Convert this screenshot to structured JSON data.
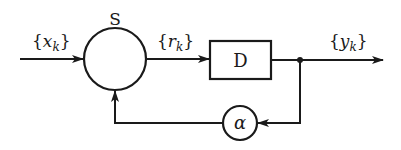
{
  "diagram": {
    "type": "block-diagram",
    "colors": {
      "stroke": "#1a1a1a",
      "background": "#ffffff"
    },
    "nodes": {
      "summer": {
        "label": "S",
        "shape": "circle"
      },
      "delay": {
        "label": "D",
        "shape": "rectangle"
      },
      "gain": {
        "label": "α",
        "shape": "circle"
      }
    },
    "signals": {
      "input": {
        "open": "{",
        "var": "x",
        "sub": "k",
        "close": "}"
      },
      "residual": {
        "open": "{",
        "var": "r",
        "sub": "k",
        "close": "}"
      },
      "output": {
        "open": "{",
        "var": "y",
        "sub": "k",
        "close": "}"
      }
    },
    "edges": [
      {
        "from": "input",
        "to": "summer"
      },
      {
        "from": "summer",
        "to": "delay",
        "signal": "residual"
      },
      {
        "from": "delay",
        "to": "output"
      },
      {
        "from": "output-junction",
        "to": "gain"
      },
      {
        "from": "gain",
        "to": "summer"
      }
    ]
  }
}
